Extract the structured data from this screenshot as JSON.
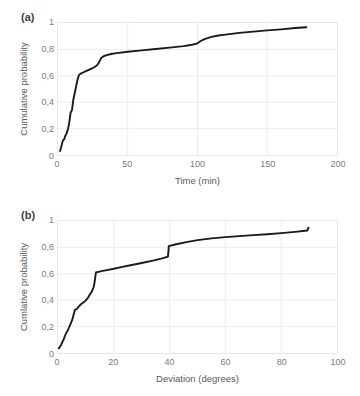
{
  "figure": {
    "background": "#ffffff",
    "line_color": "#1a1a1a",
    "grid_color": "#ededed",
    "axis_text_color": "#7b7b7b"
  },
  "panels": [
    {
      "tag": "(a)",
      "ylabel": "Cumulative probability",
      "xlabel": "Time (min)",
      "yticks": [
        "0",
        "0,2",
        "0,4",
        "0,6",
        "0,8",
        "1"
      ],
      "xticks": [
        "0",
        "50",
        "100",
        "150",
        "200"
      ]
    },
    {
      "tag": "(b)",
      "ylabel": "Cumlative probability",
      "xlabel": "Deviation (degrees)",
      "yticks": [
        "0",
        "0,2",
        "0,4",
        "0,6",
        "0,8",
        "1"
      ],
      "xticks": [
        "0",
        "20",
        "40",
        "60",
        "80",
        "100"
      ]
    }
  ],
  "chart_data": [
    {
      "type": "line",
      "panel": "(a)",
      "title": "",
      "xlabel": "Time (min)",
      "ylabel": "Cumulative probability",
      "xlim": [
        0,
        200
      ],
      "ylim": [
        0,
        1
      ],
      "xticks": [
        0,
        50,
        100,
        150,
        200
      ],
      "yticks": [
        0,
        0.2,
        0.4,
        0.6,
        0.8,
        1
      ],
      "grid": true,
      "legend": "none",
      "series": [
        {
          "name": "Cumulative distribution of time",
          "x": [
            1.5,
            2.0,
            3.0,
            3.5,
            4.5,
            5.0,
            6.0,
            6.5,
            7.0,
            8.0,
            8.5,
            9.0,
            10.0,
            10.5,
            11.0,
            12.0,
            13.0,
            14.0,
            15.0,
            16.0,
            17.0,
            18.0,
            20.0,
            22.0,
            24.0,
            26.0,
            28.0,
            29.0,
            30.0,
            31.0,
            33.0,
            35.0,
            38.0,
            42.0,
            50.0,
            60.0,
            70.0,
            80.0,
            90.0,
            95.0,
            99.0,
            100.0,
            102.0,
            105.0,
            110.0,
            115.0,
            120.0,
            130.0,
            140.0,
            150.0,
            160.0,
            170.0,
            178.0
          ],
          "y": [
            0.03,
            0.05,
            0.09,
            0.11,
            0.12,
            0.14,
            0.16,
            0.175,
            0.19,
            0.24,
            0.28,
            0.32,
            0.34,
            0.38,
            0.42,
            0.47,
            0.52,
            0.57,
            0.605,
            0.615,
            0.62,
            0.625,
            0.635,
            0.645,
            0.655,
            0.665,
            0.68,
            0.695,
            0.715,
            0.735,
            0.75,
            0.757,
            0.765,
            0.772,
            0.782,
            0.793,
            0.803,
            0.813,
            0.825,
            0.833,
            0.843,
            0.846,
            0.862,
            0.878,
            0.895,
            0.905,
            0.912,
            0.925,
            0.935,
            0.944,
            0.952,
            0.962,
            0.968
          ]
        }
      ]
    },
    {
      "type": "line",
      "panel": "(b)",
      "title": "",
      "xlabel": "Deviation (degrees)",
      "ylabel": "Cumlative probability",
      "xlim": [
        0,
        100
      ],
      "ylim": [
        0,
        1
      ],
      "xticks": [
        0,
        20,
        40,
        60,
        80,
        100
      ],
      "yticks": [
        0,
        0.2,
        0.4,
        0.6,
        0.8,
        1
      ],
      "grid": true,
      "legend": "none",
      "series": [
        {
          "name": "Cumulative distribution of deviation",
          "x": [
            0.3,
            0.8,
            1.2,
            1.6,
            2.0,
            2.4,
            2.8,
            3.2,
            3.6,
            4.0,
            4.4,
            4.8,
            5.0,
            5.2,
            5.6,
            5.8,
            6.0,
            6.4,
            6.8,
            7.2,
            7.6,
            8.0,
            8.6,
            9.2,
            9.8,
            10.4,
            10.8,
            11.2,
            11.6,
            11.8,
            12.0,
            12.4,
            12.8,
            13.0,
            13.2,
            13.4,
            13.6,
            14.5,
            16.0,
            18.0,
            20.0,
            23.0,
            26.0,
            30.0,
            34.0,
            37.0,
            39.4,
            39.6,
            39.7,
            42.0,
            46.0,
            50.0,
            55.0,
            60.0,
            65.0,
            70.0,
            75.0,
            80.0,
            85.0,
            89.4,
            89.6,
            89.8
          ],
          "y": [
            0.035,
            0.05,
            0.065,
            0.085,
            0.1,
            0.125,
            0.145,
            0.16,
            0.175,
            0.195,
            0.215,
            0.235,
            0.245,
            0.26,
            0.29,
            0.305,
            0.325,
            0.33,
            0.335,
            0.345,
            0.355,
            0.365,
            0.375,
            0.385,
            0.395,
            0.41,
            0.42,
            0.435,
            0.45,
            0.455,
            0.46,
            0.48,
            0.5,
            0.52,
            0.55,
            0.58,
            0.61,
            0.615,
            0.622,
            0.63,
            0.638,
            0.652,
            0.665,
            0.682,
            0.7,
            0.715,
            0.73,
            0.775,
            0.81,
            0.822,
            0.84,
            0.855,
            0.868,
            0.878,
            0.885,
            0.893,
            0.9,
            0.908,
            0.918,
            0.928,
            0.945,
            0.948
          ]
        }
      ]
    }
  ]
}
